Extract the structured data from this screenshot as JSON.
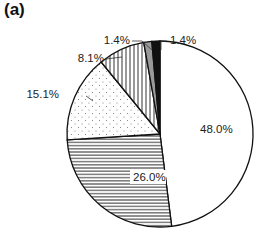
{
  "panel_label": "(a)",
  "chart_data": {
    "type": "pie",
    "title": "",
    "start_angle": "12 o'clock",
    "direction": "clockwise",
    "slices": [
      {
        "value": 48.0,
        "label": "48.0%",
        "fill": "white"
      },
      {
        "value": 26.0,
        "label": "26.0%",
        "fill": "horizontal-lines"
      },
      {
        "value": 15.1,
        "label": "15.1%",
        "fill": "dots"
      },
      {
        "value": 8.1,
        "label": "8.1%",
        "fill": "vertical-lines"
      },
      {
        "value": 1.4,
        "label": "1.4%",
        "fill": "gray"
      },
      {
        "value": 1.4,
        "label": "1.4%",
        "fill": "black"
      }
    ],
    "legend": "none"
  },
  "colors": {
    "outline": "#111111",
    "gray": "#9a9a9a",
    "black": "#111111",
    "text": "#222222"
  }
}
